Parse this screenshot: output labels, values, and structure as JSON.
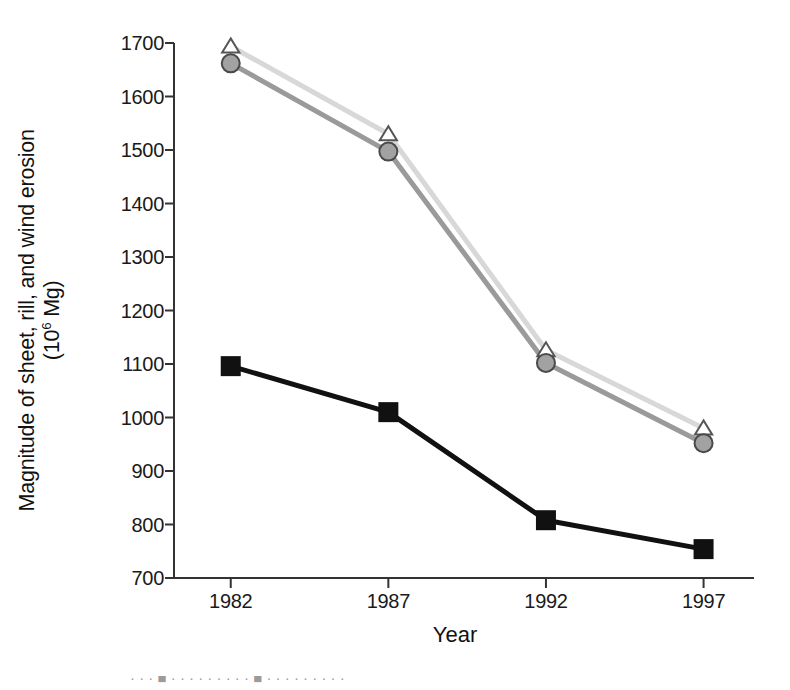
{
  "chart_data": {
    "type": "line",
    "title": "",
    "subtitle": "",
    "xlabel": "Year",
    "ylabel": "Magnitude of sheet, rill, and wind erosion (10⁶ Mg)",
    "ylabel_line1": "Magnitude of sheet, rill, and wind erosion",
    "ylabel_line2_prefix": "(10",
    "ylabel_line2_sup": "6",
    "ylabel_line2_suffix": " Mg)",
    "categories": [
      "1982",
      "1987",
      "1992",
      "1997"
    ],
    "x": [
      1982,
      1987,
      1992,
      1997
    ],
    "xlim": [
      1980.2,
      1998.6
    ],
    "ylim": [
      700,
      1700
    ],
    "ytick_labels": [
      "1700",
      "1600",
      "1500",
      "1400",
      "1300",
      "1200",
      "1100",
      "1000",
      "900",
      "800",
      "700"
    ],
    "yticks": [
      1700,
      1600,
      1500,
      1400,
      1300,
      1200,
      1100,
      1000,
      900,
      800,
      700
    ],
    "ytick_step": 100,
    "grid": false,
    "legend_position": "below-figure-cropped",
    "series": [
      {
        "name": "Triangle series (open triangle, light gray line)",
        "marker": "triangle-open",
        "color": "#d8d8d8",
        "marker_edge_color": "#555555",
        "marker_fill": "#ffffff",
        "values": [
          1694,
          1530,
          1126,
          980
        ]
      },
      {
        "name": "Circle series (gray filled circle, gray line)",
        "marker": "circle-filled",
        "color": "#9a9a9a",
        "marker_edge_color": "#4a4a4a",
        "marker_fill": "#a2a2a2",
        "values": [
          1662,
          1497,
          1102,
          952
        ]
      },
      {
        "name": "Square series (black filled square, black line)",
        "marker": "square-filled",
        "color": "#111111",
        "marker_edge_color": "#111111",
        "marker_fill": "#111111",
        "values": [
          1096,
          1010,
          808,
          754
        ]
      }
    ]
  },
  "axis": {
    "x_title": "Year",
    "y_tick_labels": [
      "1700",
      "1600",
      "1500",
      "1400",
      "1300",
      "1200",
      "1100",
      "1000",
      "900",
      "800",
      "700"
    ],
    "x_tick_labels": [
      "1982",
      "1987",
      "1992",
      "1997"
    ]
  },
  "caption": {
    "text": "· · ·  ■  · · · · · · · · ·  ■  · · · · · · · · ·"
  },
  "colors": {
    "axis": "#333333",
    "triangle_line": "#d8d8d8",
    "circle_line": "#9a9a9a",
    "square_line": "#111111",
    "text": "#1a1a1a",
    "background": "#ffffff"
  }
}
